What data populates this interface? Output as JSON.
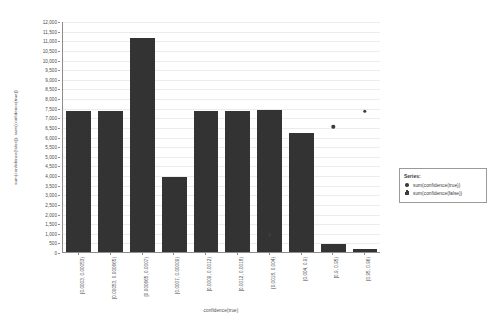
{
  "chart_data": {
    "type": "bar",
    "title": "",
    "xlabel": "confidence(true)",
    "ylabel": "sum(confidence(false)), sum(confidence(true))",
    "ylim": [
      0,
      12000
    ],
    "ytick_step": 500,
    "grid": true,
    "legend_position": "right",
    "categories": [
      "[0.0003, 0.00053)",
      "[0.00053, 0.000665)",
      "[0.000665, 0.0007)",
      "[0.0007, 0.00009)",
      "[0.0009, 0.0012)",
      "[0.0012, 0.0018)",
      "[0.0018, 0.004)",
      "[0.004, 0.9)",
      "[0.9, 0.95)",
      "[0.95, 0.96)"
    ],
    "ytick_labels": [
      "12,000",
      "11,500",
      "11,000",
      "10,500",
      "10,000",
      "9,500",
      "9,000",
      "8,500",
      "8,000",
      "7,500",
      "7,000",
      "6,500",
      "6,000",
      "5,500",
      "5,000",
      "4,500",
      "4,000",
      "3,500",
      "3,000",
      "2,500",
      "2,000",
      "1,500",
      "1,000",
      "500",
      "0"
    ],
    "series": [
      {
        "name": "sum(confidence(false))",
        "type": "bar",
        "marker": "bar-icon",
        "color": "#333333",
        "values": [
          7300,
          7300,
          11100,
          3900,
          7300,
          7300,
          7400,
          6200,
          400,
          150
        ]
      },
      {
        "name": "sum(confidence(true))",
        "type": "scatter",
        "marker": "circle-icon",
        "color": "#3c3c3c",
        "values": [
          null,
          null,
          null,
          null,
          null,
          null,
          900,
          null,
          6500,
          7300
        ]
      }
    ]
  },
  "legend": {
    "title": "Series:",
    "entries": [
      {
        "label": "sum(confidence(true))",
        "marker": "circle-icon"
      },
      {
        "label": "sum(confidence(false))",
        "marker": "bar-icon"
      }
    ]
  }
}
